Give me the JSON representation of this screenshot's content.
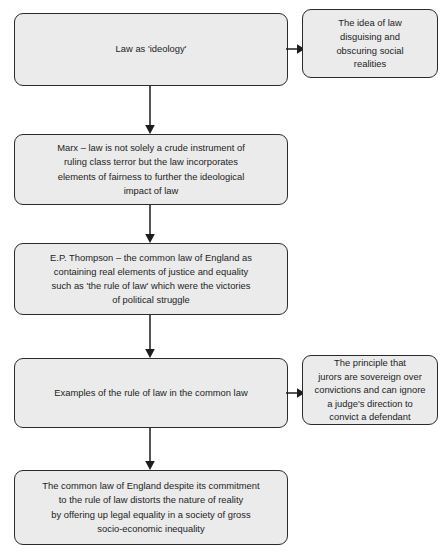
{
  "diagram": {
    "style": {
      "node_fill": "#ebebeb",
      "node_border": "#2b2b2b",
      "text_color": "#1d1d1d",
      "background": "#ffffff",
      "arrow_color": "#1d1d1d"
    },
    "watermark_text": "Law as 'ideology'",
    "nodes": {
      "n1": {
        "label": "Law as 'ideology'"
      },
      "n1_side": {
        "label": "The idea of law\ndisguising and\nobscuring social\nrealities"
      },
      "n2": {
        "label": "Marx – law is not solely a crude instrument of\nruling class terror but the law incorporates\nelements of fairness to further the ideological\nimpact of law"
      },
      "n3": {
        "label": "E.P. Thompson – the common law of England as\ncontaining real elements of justice and equality\nsuch as 'the rule of law' which were the victories\nof political struggle"
      },
      "n4": {
        "label": "Examples of the rule of law in the common law"
      },
      "n4_side": {
        "label": "The principle that\njurors are sovereign over\nconvictions and can ignore\na judge's direction to\nconvict a defendant"
      },
      "n5": {
        "label": "The common law of England despite its commitment\nto the rule of law distorts the nature of reality\nby offering up legal equality in a society of gross\nsocio-economic inequality"
      }
    },
    "edges": [
      {
        "id": "e1",
        "from": "n1",
        "to": "n1_side",
        "direction": "right"
      },
      {
        "id": "e2",
        "from": "n1",
        "to": "n2",
        "direction": "down"
      },
      {
        "id": "e3",
        "from": "n2",
        "to": "n3",
        "direction": "down"
      },
      {
        "id": "e4",
        "from": "n3",
        "to": "n4",
        "direction": "down"
      },
      {
        "id": "e5",
        "from": "n4",
        "to": "n4_side",
        "direction": "right"
      },
      {
        "id": "e6",
        "from": "n4",
        "to": "n5",
        "direction": "down"
      }
    ]
  }
}
